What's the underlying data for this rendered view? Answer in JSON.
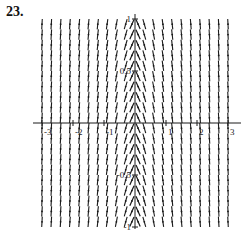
{
  "problem": {
    "label": "23."
  },
  "chart_data": {
    "type": "direction_field",
    "title": "",
    "xlabel": "",
    "ylabel": "",
    "xlim": [
      -3,
      3
    ],
    "ylim": [
      -1,
      1
    ],
    "grid": false,
    "x_ticks": [
      {
        "value": -3,
        "label": "-3"
      },
      {
        "value": -2,
        "label": "-2"
      },
      {
        "value": -1,
        "label": "-1"
      },
      {
        "value": 1,
        "label": "1"
      },
      {
        "value": 2,
        "label": "2"
      },
      {
        "value": 3,
        "label": "3"
      }
    ],
    "y_ticks": [
      {
        "value": 1,
        "label": "1"
      },
      {
        "value": 0.5,
        "label": "0.5"
      },
      {
        "value": -0.5,
        "label": "-0.5"
      },
      {
        "value": -1,
        "label": "-1"
      }
    ],
    "field_columns_x": [
      -3,
      -2.7,
      -2.4,
      -2.1,
      -1.8,
      -1.5,
      -1.2,
      -0.9,
      -0.6,
      -0.3,
      -0.1,
      0.1,
      0.3,
      0.6,
      0.9,
      1.2,
      1.5,
      1.8,
      2.1,
      2.4,
      2.7,
      3
    ],
    "field_rows_y": [
      0.95,
      0.85,
      0.75,
      0.65,
      0.55,
      0.45,
      0.35,
      0.25,
      0.15,
      0.05,
      -0.05,
      -0.15,
      -0.25,
      -0.35,
      -0.45,
      -0.55,
      -0.65,
      -0.75,
      -0.85,
      -0.95
    ]
  },
  "colors": {
    "ink": "#1a1a1a",
    "background": "#ffffff"
  }
}
